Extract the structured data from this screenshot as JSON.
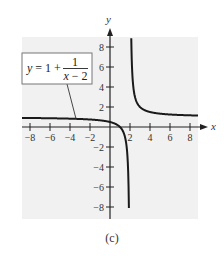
{
  "chart_data": {
    "type": "line",
    "title": "",
    "function": "y = 1 + 1/(x - 2)",
    "xlabel": "x",
    "ylabel": "y",
    "xlim": [
      -8.8,
      8.8
    ],
    "ylim": [
      -9.2,
      8.9
    ],
    "x_ticks": [
      -8,
      -6,
      -4,
      -2,
      2,
      4,
      6,
      8
    ],
    "x_tick_labels": [
      "−8",
      "−6",
      "−4",
      "−2",
      "2",
      "4",
      "6",
      "8"
    ],
    "y_ticks": [
      8,
      6,
      4,
      2,
      -2,
      -4,
      -6,
      -8
    ],
    "y_tick_labels": [
      "8",
      "6",
      "4",
      "2",
      "−2",
      "−4",
      "−6",
      "−8"
    ],
    "vertical_asymptote": 2,
    "horizontal_asymptote": 1,
    "series": [
      {
        "name": "left branch",
        "x": [
          -8.8,
          -8,
          -6,
          -4,
          -2,
          0,
          1,
          1.5,
          1.7,
          1.8,
          1.85,
          1.89
        ],
        "values": [
          0.907,
          0.9,
          0.875,
          0.833,
          0.75,
          0.5,
          0.0,
          -1.0,
          -2.333,
          -4.0,
          -5.667,
          -8.09
        ]
      },
      {
        "name": "right branch",
        "x": [
          2.127,
          2.15,
          2.2,
          2.3,
          2.5,
          3,
          4,
          6,
          8,
          8.8
        ],
        "values": [
          8.87,
          7.667,
          6.0,
          4.333,
          3.0,
          2.0,
          1.5,
          1.25,
          1.167,
          1.147
        ]
      }
    ],
    "annotation": {
      "text_lhs": "y = 1 +",
      "numerator": "1",
      "denominator": "x − 2",
      "points_to": [
        -3.4,
        0.82
      ]
    },
    "grid": false,
    "legend": "none",
    "caption": "(c)"
  },
  "colors": {
    "plot_background": "#f1f1f1",
    "curve": "#1a1a1a",
    "axis": "#222222"
  }
}
